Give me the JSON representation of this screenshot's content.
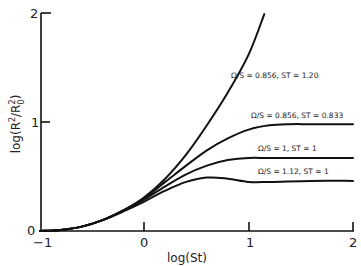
{
  "chart_data": {
    "type": "line",
    "title": "",
    "xlabel": "log(St)",
    "ylabel": "log(R²/R₀²)",
    "xlim": [
      -1,
      2
    ],
    "ylim": [
      0,
      2
    ],
    "x_ticks": [
      -1,
      0,
      1,
      2
    ],
    "x_tick_labels": [
      "−1",
      "0",
      "1",
      "2"
    ],
    "y_ticks": [
      0,
      1,
      2
    ],
    "y_tick_labels": [
      "0",
      "1",
      "2"
    ],
    "grid": false,
    "legend": "inline labels next to curves",
    "series": [
      {
        "name": "Ω/S = 0.856, ST = 1.20",
        "label": "Ω/S = 0.856,   ST = 1.20",
        "x": [
          -1.0,
          -0.8,
          -0.6,
          -0.4,
          -0.2,
          0.0,
          0.2,
          0.4,
          0.6,
          0.8,
          1.0,
          1.15
        ],
        "y": [
          0.0,
          0.01,
          0.04,
          0.1,
          0.19,
          0.31,
          0.48,
          0.7,
          0.97,
          1.27,
          1.62,
          1.99
        ]
      },
      {
        "name": "Ω/S = 0.856, ST = 0.833",
        "label": "Ω/S = 0.856,  ST = 0.833",
        "x": [
          -1.0,
          -0.8,
          -0.6,
          -0.4,
          -0.2,
          0.0,
          0.2,
          0.4,
          0.6,
          0.8,
          1.0,
          1.2,
          1.4,
          1.6,
          2.0
        ],
        "y": [
          0.0,
          0.01,
          0.04,
          0.1,
          0.19,
          0.3,
          0.45,
          0.6,
          0.74,
          0.85,
          0.93,
          0.97,
          0.98,
          0.98,
          0.98
        ]
      },
      {
        "name": "Ω/S = 1, ST = 1",
        "label": "Ω/S = 1,  ST = 1",
        "x": [
          -1.0,
          -0.8,
          -0.6,
          -0.4,
          -0.2,
          0.0,
          0.2,
          0.4,
          0.6,
          0.8,
          1.0,
          1.2,
          1.6,
          2.0
        ],
        "y": [
          0.0,
          0.01,
          0.04,
          0.1,
          0.19,
          0.29,
          0.41,
          0.52,
          0.6,
          0.65,
          0.67,
          0.67,
          0.67,
          0.67
        ]
      },
      {
        "name": "Ω/S = 1.12, ST = 1",
        "label": "Ω/S = 1.12,   ST = 1",
        "x": [
          -1.0,
          -0.8,
          -0.6,
          -0.4,
          -0.2,
          0.0,
          0.2,
          0.4,
          0.6,
          0.8,
          1.0,
          1.2,
          1.6,
          2.0
        ],
        "y": [
          0.0,
          0.01,
          0.04,
          0.1,
          0.18,
          0.27,
          0.37,
          0.45,
          0.49,
          0.48,
          0.45,
          0.45,
          0.46,
          0.46
        ]
      }
    ]
  },
  "labels": {
    "xlabel": "log(St)",
    "ylabel_main": "log(R",
    "curve1": "Ω/S = 0.856,   ST = 1.20",
    "curve2": "Ω/S = 0.856,  ST = 0.833",
    "curve3": "Ω/S = 1,  ST = 1",
    "curve4": "Ω/S = 1.12,   ST = 1"
  },
  "axis_ticks": {
    "x": [
      "−1",
      "0",
      "1",
      "2"
    ],
    "y": [
      "0",
      "1",
      "2"
    ]
  }
}
